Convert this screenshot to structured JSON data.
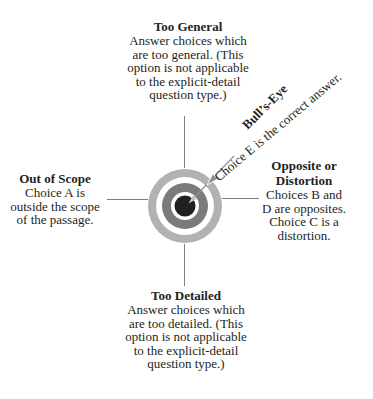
{
  "diagram": {
    "text_color": "#231f20",
    "line_color": "#7f7e7c",
    "quadrants": {
      "top": {
        "heading": "Too General",
        "lines": [
          "Answer choices which",
          "are too general. (This",
          "option is not applicable",
          "to the explicit-detail",
          "question type.)"
        ]
      },
      "left": {
        "heading": "Out of Scope",
        "lines": [
          "Choice A is",
          "outside the scope",
          "of the passage."
        ]
      },
      "right": {
        "heading_lines": [
          "Opposite or",
          "Distortion"
        ],
        "lines": [
          "Choices B and",
          "D are opposites.",
          "Choice C is a",
          "distortion."
        ]
      },
      "bottom": {
        "heading": "Too Detailed",
        "lines": [
          "Answer choices which",
          "are too detailed. (This",
          "option is not applicable",
          "to the explicit-detail",
          "question type.)"
        ]
      }
    },
    "bullseye": {
      "heading": "Bull’s-Eye",
      "caption": "Choice E is the correct answer."
    },
    "target_colors": {
      "outer_ring": "#b3b2b0",
      "gap": "#ffffff",
      "middle_ring": "#7c7b79",
      "center": "#21201e",
      "arrow_shaft": "#95948c",
      "arrow_head": "#8e8d8b",
      "arrow_tip": "#c4c3c1"
    }
  }
}
